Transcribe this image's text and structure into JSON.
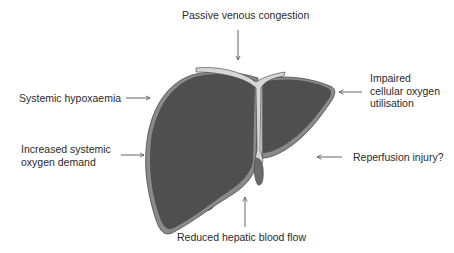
{
  "diagram": {
    "labels": {
      "top": "Passive venous congestion",
      "left_upper": "Systemic hypoxaemia",
      "left_lower_line1": "Increased systemic",
      "left_lower_line2": "oxygen demand",
      "right_upper_line1": "Impaired",
      "right_upper_line2": "cellular oxygen",
      "right_upper_line3": "utilisation",
      "right_lower": "Reperfusion injury?",
      "bottom": "Reduced hepatic blood flow"
    },
    "colors": {
      "liver_fill": "#4f4f4f",
      "liver_edge": "#8a8a8a",
      "ligament": "#d6d6d6",
      "arrow": "#555555",
      "text": "#2a2a2a"
    }
  }
}
